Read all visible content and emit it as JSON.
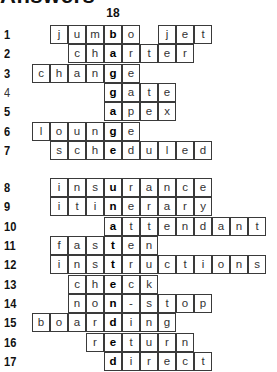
{
  "page": {
    "title": "Answers",
    "key_column_label": "18",
    "key_column_index": 4
  },
  "grid": {
    "origin_x": 32,
    "cell_width": 18,
    "row_height": 19.3,
    "section_gap": 18
  },
  "rows": [
    {
      "number": "1",
      "start_col": 1,
      "cells": [
        "j",
        "u",
        "m",
        "b",
        "o",
        "",
        "j",
        "e",
        "t"
      ],
      "key_letter": "b",
      "section": 1
    },
    {
      "number": "2",
      "start_col": 2,
      "cells": [
        "c",
        "h",
        "a",
        "r",
        "t",
        "e",
        "r"
      ],
      "key_letter": "a",
      "section": 1
    },
    {
      "number": "3",
      "start_col": 0,
      "cells": [
        "c",
        "h",
        "a",
        "n",
        "g",
        "e"
      ],
      "key_letter": "g",
      "section": 1
    },
    {
      "number": "4",
      "start_col": 4,
      "cells": [
        "g",
        "a",
        "t",
        "e"
      ],
      "key_letter": "g",
      "section": 1,
      "light": true
    },
    {
      "number": "5",
      "start_col": 4,
      "cells": [
        "a",
        "p",
        "e",
        "x"
      ],
      "key_letter": "a",
      "section": 1
    },
    {
      "number": "6",
      "start_col": 0,
      "cells": [
        "l",
        "o",
        "u",
        "n",
        "g",
        "e"
      ],
      "key_letter": "g",
      "section": 1
    },
    {
      "number": "7",
      "start_col": 1,
      "cells": [
        "s",
        "c",
        "h",
        "e",
        "d",
        "u",
        "l",
        "e",
        "d"
      ],
      "key_letter": "e",
      "section": 1
    },
    {
      "number": "8",
      "start_col": 1,
      "cells": [
        "i",
        "n",
        "s",
        "u",
        "r",
        "a",
        "n",
        "c",
        "e"
      ],
      "key_letter": "u",
      "section": 2
    },
    {
      "number": "9",
      "start_col": 1,
      "cells": [
        "i",
        "t",
        "i",
        "n",
        "e",
        "r",
        "a",
        "r",
        "y"
      ],
      "key_letter": "n",
      "section": 2
    },
    {
      "number": "10",
      "start_col": 4,
      "cells": [
        "a",
        "t",
        "t",
        "e",
        "n",
        "d",
        "a",
        "n",
        "t"
      ],
      "key_letter": "a",
      "section": 2
    },
    {
      "number": "11",
      "start_col": 1,
      "cells": [
        "f",
        "a",
        "s",
        "t",
        "e",
        "n"
      ],
      "key_letter": "t",
      "section": 2
    },
    {
      "number": "12",
      "start_col": 1,
      "cells": [
        "i",
        "n",
        "s",
        "t",
        "r",
        "u",
        "c",
        "t",
        "i",
        "o",
        "n",
        "s"
      ],
      "key_letter": "t",
      "section": 2
    },
    {
      "number": "13",
      "start_col": 2,
      "cells": [
        "c",
        "h",
        "e",
        "c",
        "k"
      ],
      "key_letter": "e",
      "section": 2
    },
    {
      "number": "14",
      "start_col": 2,
      "cells": [
        "n",
        "o",
        "n",
        "-",
        "s",
        "t",
        "o",
        "p"
      ],
      "key_letter": "n",
      "section": 2
    },
    {
      "number": "15",
      "start_col": 0,
      "cells": [
        "b",
        "o",
        "a",
        "r",
        "d",
        "i",
        "n",
        "g"
      ],
      "key_letter": "d",
      "section": 2
    },
    {
      "number": "16",
      "start_col": 3,
      "cells": [
        "r",
        "e",
        "t",
        "u",
        "r",
        "n"
      ],
      "key_letter": "e",
      "section": 2
    },
    {
      "number": "17",
      "start_col": 4,
      "cells": [
        "d",
        "i",
        "r",
        "e",
        "c",
        "t"
      ],
      "key_letter": "d",
      "section": 2
    }
  ],
  "hidden_word": "bag gage unattended"
}
